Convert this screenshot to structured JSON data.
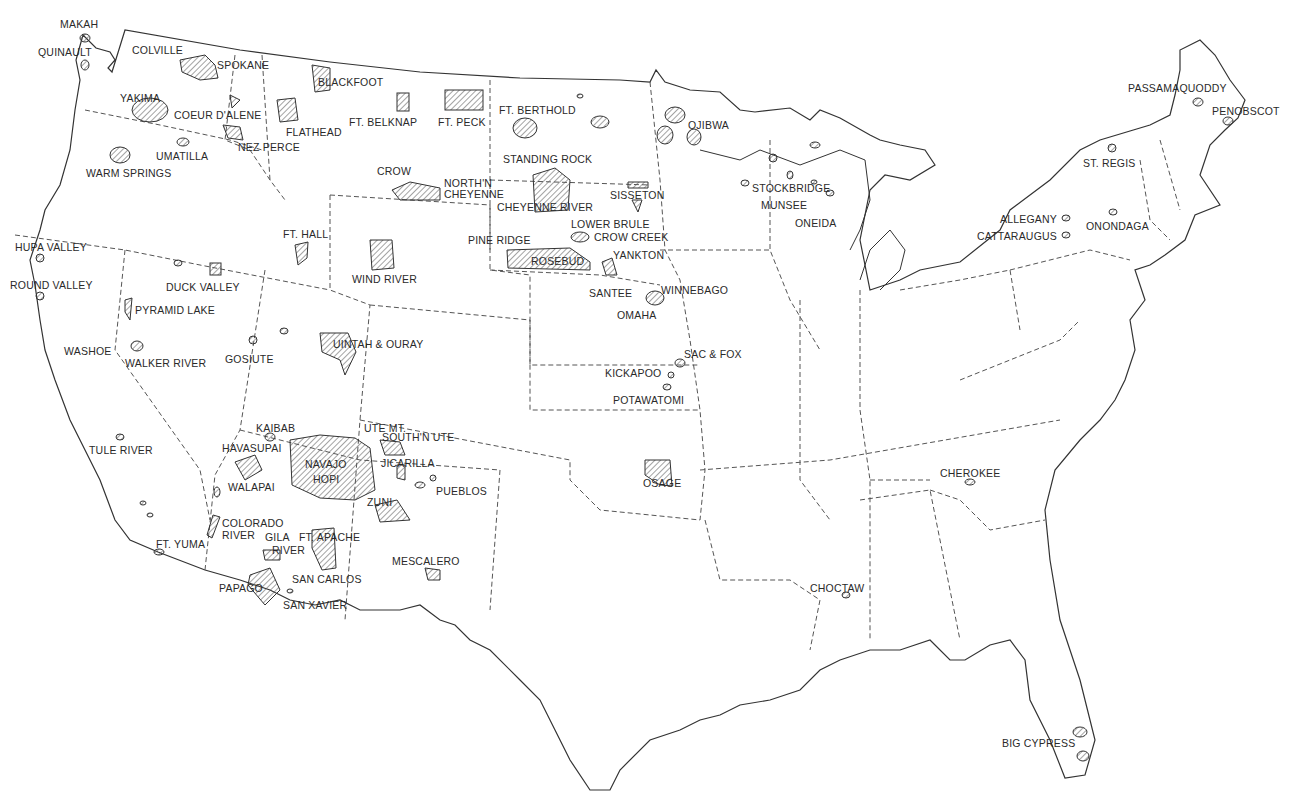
{
  "map": {
    "subject": "Indian reservations of the contiguous United States",
    "colors": {
      "ink": "#2a2a2a",
      "hatch": "#555555",
      "background": "#ffffff"
    },
    "labels": [
      {
        "name": "MAKAH",
        "x": 60,
        "y": 19
      },
      {
        "name": "QUINAULT",
        "x": 38,
        "y": 47
      },
      {
        "name": "COLVILLE",
        "x": 132,
        "y": 45
      },
      {
        "name": "SPOKANE",
        "x": 217,
        "y": 60
      },
      {
        "name": "BLACKFOOT",
        "x": 318,
        "y": 77
      },
      {
        "name": "YAKIMA",
        "x": 120,
        "y": 93
      },
      {
        "name": "COEUR D'ALENE",
        "x": 174,
        "y": 110
      },
      {
        "name": "FLATHEAD",
        "x": 286,
        "y": 127
      },
      {
        "name": "NEZ PERCE",
        "x": 238,
        "y": 142
      },
      {
        "name": "UMATILLA",
        "x": 156,
        "y": 151
      },
      {
        "name": "WARM SPRINGS",
        "x": 86,
        "y": 168
      },
      {
        "name": "FT. BELKNAP",
        "x": 349,
        "y": 117
      },
      {
        "name": "FT. PECK",
        "x": 438,
        "y": 117
      },
      {
        "name": "FT. BERTHOLD",
        "x": 499,
        "y": 105
      },
      {
        "name": "OJIBWA",
        "x": 688,
        "y": 120
      },
      {
        "name": "STANDING ROCK",
        "x": 503,
        "y": 154
      },
      {
        "name": "CROW",
        "x": 377,
        "y": 166
      },
      {
        "name": "NORTH'N",
        "x": 444,
        "y": 178
      },
      {
        "name": "CHEYENNE",
        "x": 444,
        "y": 189
      },
      {
        "name": "CHEYENNE RIVER",
        "x": 497,
        "y": 202
      },
      {
        "name": "SISSETON",
        "x": 610,
        "y": 190
      },
      {
        "name": "STOCKBRIDGE",
        "x": 752,
        "y": 183
      },
      {
        "name": "MUNSEE",
        "x": 761,
        "y": 200
      },
      {
        "name": "ONEIDA",
        "x": 795,
        "y": 218
      },
      {
        "name": "LOWER BRULE",
        "x": 571,
        "y": 219
      },
      {
        "name": "CROW CREEK",
        "x": 594,
        "y": 232
      },
      {
        "name": "PINE RIDGE",
        "x": 468,
        "y": 235
      },
      {
        "name": "YANKTON",
        "x": 613,
        "y": 250
      },
      {
        "name": "ROSEBUD",
        "x": 531,
        "y": 256
      },
      {
        "name": "SANTEE",
        "x": 589,
        "y": 288
      },
      {
        "name": "WINNEBAGO",
        "x": 661,
        "y": 285
      },
      {
        "name": "OMAHA",
        "x": 617,
        "y": 310
      },
      {
        "name": "FT. HALL",
        "x": 283,
        "y": 229
      },
      {
        "name": "WIND RIVER",
        "x": 352,
        "y": 274
      },
      {
        "name": "HUPA VALLEY",
        "x": 15,
        "y": 242
      },
      {
        "name": "ROUND VALLEY",
        "x": 10,
        "y": 280
      },
      {
        "name": "DUCK VALLEY",
        "x": 166,
        "y": 282
      },
      {
        "name": "PYRAMID LAKE",
        "x": 135,
        "y": 305
      },
      {
        "name": "WASHOE",
        "x": 64,
        "y": 346
      },
      {
        "name": "WALKER RIVER",
        "x": 125,
        "y": 358
      },
      {
        "name": "GOSIUTE",
        "x": 225,
        "y": 354
      },
      {
        "name": "UINTAH & OURAY",
        "x": 333,
        "y": 339
      },
      {
        "name": "SAC & FOX",
        "x": 684,
        "y": 349
      },
      {
        "name": "KICKAPOO",
        "x": 605,
        "y": 368
      },
      {
        "name": "POTAWATOMI",
        "x": 613,
        "y": 395
      },
      {
        "name": "TULE RIVER",
        "x": 89,
        "y": 445
      },
      {
        "name": "KAIBAB",
        "x": 256,
        "y": 423
      },
      {
        "name": "HAVASUPAI",
        "x": 222,
        "y": 443
      },
      {
        "name": "UTE MT.",
        "x": 364,
        "y": 423
      },
      {
        "name": "SOUTH'N UTE",
        "x": 382,
        "y": 432
      },
      {
        "name": "NAVAJO",
        "x": 305,
        "y": 459
      },
      {
        "name": "HOPI",
        "x": 313,
        "y": 474
      },
      {
        "name": "JICARILLA",
        "x": 381,
        "y": 458
      },
      {
        "name": "WALAPAI",
        "x": 228,
        "y": 482
      },
      {
        "name": "PUEBLOS",
        "x": 436,
        "y": 486
      },
      {
        "name": "ZUNI",
        "x": 367,
        "y": 497
      },
      {
        "name": "OSAGE",
        "x": 643,
        "y": 478
      },
      {
        "name": "CHEROKEE",
        "x": 940,
        "y": 468
      },
      {
        "name": "COLORADO",
        "x": 222,
        "y": 518
      },
      {
        "name": "RIVER",
        "x": 222,
        "y": 530
      },
      {
        "name": "GILA",
        "x": 265,
        "y": 532
      },
      {
        "name": "RIVER",
        "x": 272,
        "y": 545
      },
      {
        "name": "FT. APACHE",
        "x": 299,
        "y": 532
      },
      {
        "name": "FT. YUMA",
        "x": 156,
        "y": 539
      },
      {
        "name": "MESCALERO",
        "x": 392,
        "y": 556
      },
      {
        "name": "SAN CARLOS",
        "x": 292,
        "y": 574
      },
      {
        "name": "PAPAGO",
        "x": 219,
        "y": 583
      },
      {
        "name": "SAN XAVIER",
        "x": 283,
        "y": 600
      },
      {
        "name": "CHOCTAW",
        "x": 810,
        "y": 583
      },
      {
        "name": "BIG CYPRESS",
        "x": 1002,
        "y": 738
      },
      {
        "name": "PASSAMAQUODDY",
        "x": 1128,
        "y": 83
      },
      {
        "name": "PENOBSCOT",
        "x": 1212,
        "y": 106
      },
      {
        "name": "ST. REGIS",
        "x": 1083,
        "y": 158
      },
      {
        "name": "ALLEGANY",
        "x": 1000,
        "y": 214
      },
      {
        "name": "ONONDAGA",
        "x": 1086,
        "y": 221
      },
      {
        "name": "CATTARAUGUS",
        "x": 977,
        "y": 231
      }
    ]
  }
}
